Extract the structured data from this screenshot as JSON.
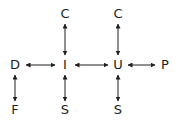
{
  "diagram": {
    "canvas": {
      "width": 189,
      "height": 131,
      "background": "#ffffff"
    },
    "style": {
      "line_color": "#231f20",
      "text_color": "#231f20",
      "line_width": 1,
      "arrow": "double-headed"
    },
    "nodes": [
      {
        "id": "c-top-left",
        "label": "C",
        "x": 65,
        "y": 14
      },
      {
        "id": "c-top-right",
        "label": "C",
        "x": 118,
        "y": 14
      },
      {
        "id": "d",
        "label": "D",
        "x": 15,
        "y": 65
      },
      {
        "id": "i",
        "label": "I",
        "x": 65,
        "y": 65
      },
      {
        "id": "u",
        "label": "U",
        "x": 118,
        "y": 65
      },
      {
        "id": "p",
        "label": "P",
        "x": 165,
        "y": 65
      },
      {
        "id": "f",
        "label": "F",
        "x": 15,
        "y": 110
      },
      {
        "id": "s-bottom-left",
        "label": "S",
        "x": 65,
        "y": 110
      },
      {
        "id": "s-bottom-right",
        "label": "S",
        "x": 118,
        "y": 110
      }
    ],
    "edges": [
      {
        "id": "edge-d-i",
        "from": "d",
        "to": "i",
        "orientation": "horizontal",
        "x1": 26,
        "y1": 65,
        "x2": 55,
        "y2": 65
      },
      {
        "id": "edge-i-u",
        "from": "i",
        "to": "u",
        "orientation": "horizontal",
        "x1": 75,
        "y1": 65,
        "x2": 108,
        "y2": 65
      },
      {
        "id": "edge-u-p",
        "from": "u",
        "to": "p",
        "orientation": "horizontal",
        "x1": 128,
        "y1": 65,
        "x2": 155,
        "y2": 65
      },
      {
        "id": "edge-c-i",
        "from": "c-top-left",
        "to": "i",
        "orientation": "vertical",
        "x1": 65,
        "y1": 24,
        "x2": 65,
        "y2": 55
      },
      {
        "id": "edge-c-u",
        "from": "c-top-right",
        "to": "u",
        "orientation": "vertical",
        "x1": 118,
        "y1": 24,
        "x2": 118,
        "y2": 55
      },
      {
        "id": "edge-d-f",
        "from": "d",
        "to": "f",
        "orientation": "vertical",
        "x1": 15,
        "y1": 75,
        "x2": 15,
        "y2": 101
      },
      {
        "id": "edge-i-s",
        "from": "i",
        "to": "s-bottom-left",
        "orientation": "vertical",
        "x1": 65,
        "y1": 75,
        "x2": 65,
        "y2": 101
      },
      {
        "id": "edge-u-s",
        "from": "u",
        "to": "s-bottom-right",
        "orientation": "vertical",
        "x1": 118,
        "y1": 75,
        "x2": 118,
        "y2": 101
      }
    ]
  }
}
